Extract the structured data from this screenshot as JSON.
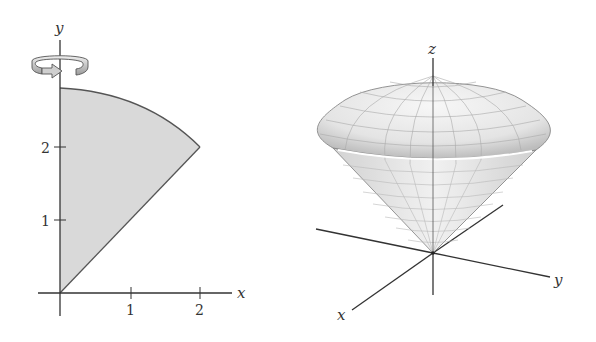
{
  "left_plot": {
    "x_axis_label": "x",
    "y_axis_label": "y",
    "x_ticks": [
      "1",
      "2"
    ],
    "y_ticks": [
      "1",
      "2"
    ],
    "region": {
      "description": "Region bounded by y = x, x = 0, and the circle x^2 + y^2 = 8",
      "fill": "#d9d9d9",
      "corner_point": [
        2,
        2
      ],
      "top_y_intercept": 2.83
    },
    "rotation_icon": "rotate-around-y-axis-icon"
  },
  "right_plot": {
    "x_axis_label": "x",
    "y_axis_label": "y",
    "z_axis_label": "z",
    "surface": "ice-cream cone solid: cone capped by spherical cap",
    "surface_color": "#e6e6e6"
  },
  "colors": {
    "axis": "#333333",
    "region_fill": "#d9d9d9",
    "region_edge": "#555555"
  }
}
